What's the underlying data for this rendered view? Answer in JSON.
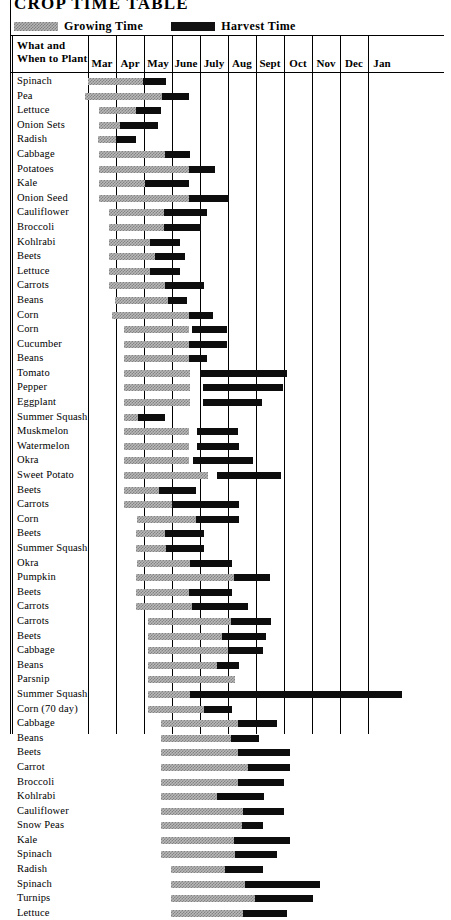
{
  "title": "CROP TIME TABLE",
  "legend": {
    "growing": {
      "label": "Growing Time",
      "swatch": "growing-time-swatch",
      "color": "#b5b5b5"
    },
    "harvest": {
      "label": "Harvest Time",
      "swatch": "harvest-time-swatch",
      "color": "#111111"
    }
  },
  "header": {
    "row_header_line1": "What and",
    "row_header_line2": "When to Plant",
    "months": [
      "Mar",
      "Apr",
      "May",
      "June",
      "July",
      "Aug",
      "Sept",
      "Oct",
      "Nov",
      "Dec",
      "Jan"
    ]
  },
  "chart_data": {
    "type": "bar",
    "title": "CROP TIME TABLE",
    "xlabel": "",
    "ylabel": "What and When to Plant",
    "categories": [
      "Mar",
      "Apr",
      "May",
      "June",
      "July",
      "Aug",
      "Sept",
      "Oct",
      "Nov",
      "Dec",
      "Jan"
    ],
    "xlim": [
      0,
      11
    ],
    "grid": true,
    "legend_position": "top-left",
    "series": [
      {
        "name": "Growing Time",
        "color": "#b5b5b5"
      },
      {
        "name": "Harvest Time",
        "color": "#111111"
      }
    ],
    "note": "x units are months from Mar 1 (0 = Mar 1, 1 = Apr 1, ... 10 = Jan 1, 11 = Feb 1)",
    "rows": [
      {
        "crop": "Spinach",
        "grow": [
          0.0,
          1.95
        ],
        "harvest": [
          1.95,
          2.8
        ]
      },
      {
        "crop": "Pea",
        "grow": [
          -0.1,
          2.65
        ],
        "harvest": [
          2.65,
          3.6
        ]
      },
      {
        "crop": "Lettuce",
        "grow": [
          0.4,
          1.7
        ],
        "harvest": [
          1.7,
          2.6
        ]
      },
      {
        "crop": "Onion Sets",
        "grow": [
          0.4,
          1.15
        ],
        "harvest": [
          1.15,
          2.5
        ]
      },
      {
        "crop": "Radish",
        "grow": [
          0.35,
          1.0
        ],
        "harvest": [
          1.0,
          1.7
        ]
      },
      {
        "crop": "Cabbage",
        "grow": [
          0.4,
          2.75
        ],
        "harvest": [
          2.75,
          3.65
        ]
      },
      {
        "crop": "Potatoes",
        "grow": [
          0.4,
          3.6
        ],
        "harvest": [
          3.6,
          4.55
        ]
      },
      {
        "crop": "Kale",
        "grow": [
          0.4,
          2.05
        ],
        "harvest": [
          2.05,
          3.6
        ]
      },
      {
        "crop": "Onion Seed",
        "grow": [
          0.4,
          3.6
        ],
        "harvest": [
          3.6,
          5.05
        ]
      },
      {
        "crop": "Cauliflower",
        "grow": [
          0.75,
          2.7
        ],
        "harvest": [
          2.7,
          4.25
        ]
      },
      {
        "crop": "Broccoli",
        "grow": [
          0.75,
          2.7
        ],
        "harvest": [
          2.7,
          4.05
        ]
      },
      {
        "crop": "Kohlrabi",
        "grow": [
          0.75,
          2.2
        ],
        "harvest": [
          2.2,
          3.3
        ]
      },
      {
        "crop": "Beets",
        "grow": [
          0.75,
          2.4
        ],
        "harvest": [
          2.4,
          3.45
        ]
      },
      {
        "crop": "Lettuce",
        "grow": [
          0.75,
          2.2
        ],
        "harvest": [
          2.2,
          3.3
        ]
      },
      {
        "crop": "Carrots",
        "grow": [
          0.75,
          2.75
        ],
        "harvest": [
          2.75,
          4.15
        ]
      },
      {
        "crop": "Beans",
        "grow": [
          0.95,
          2.85
        ],
        "harvest": [
          2.85,
          3.55
        ]
      },
      {
        "crop": "Corn",
        "grow": [
          0.85,
          3.6
        ],
        "harvest": [
          3.6,
          4.45
        ]
      },
      {
        "crop": "Corn",
        "grow": [
          1.3,
          3.6
        ],
        "harvest": [
          3.7,
          4.95
        ]
      },
      {
        "crop": "Cucumber",
        "grow": [
          1.3,
          3.6
        ],
        "harvest": [
          3.6,
          4.95
        ]
      },
      {
        "crop": "Beans",
        "grow": [
          1.3,
          3.6
        ],
        "harvest": [
          3.6,
          4.25
        ]
      },
      {
        "crop": "Tomato",
        "grow": [
          1.3,
          3.65
        ],
        "harvest": [
          4.0,
          7.1
        ]
      },
      {
        "crop": "Pepper",
        "grow": [
          1.3,
          3.65
        ],
        "harvest": [
          4.1,
          6.95
        ]
      },
      {
        "crop": "Eggplant",
        "grow": [
          1.3,
          3.65
        ],
        "harvest": [
          4.1,
          6.2
        ]
      },
      {
        "crop": "Summer Squash",
        "grow": [
          1.3,
          1.8
        ],
        "harvest": [
          1.8,
          2.75
        ]
      },
      {
        "crop": "Muskmelon",
        "grow": [
          1.3,
          3.6
        ],
        "harvest": [
          3.9,
          5.35
        ]
      },
      {
        "crop": "Watermelon",
        "grow": [
          1.3,
          3.6
        ],
        "harvest": [
          3.9,
          5.4
        ]
      },
      {
        "crop": "Okra",
        "grow": [
          1.3,
          3.6
        ],
        "harvest": [
          3.75,
          5.9
        ]
      },
      {
        "crop": "Sweet Potato",
        "grow": [
          1.3,
          4.3
        ],
        "harvest": [
          4.6,
          6.9
        ]
      },
      {
        "crop": "Beets",
        "grow": [
          1.3,
          2.55
        ],
        "harvest": [
          2.55,
          3.85
        ]
      },
      {
        "crop": "Carrots",
        "grow": [
          1.3,
          3.0
        ],
        "harvest": [
          3.0,
          5.4
        ]
      },
      {
        "crop": "Corn",
        "grow": [
          1.75,
          3.85
        ],
        "harvest": [
          3.85,
          5.4
        ]
      },
      {
        "crop": "Beets",
        "grow": [
          1.7,
          2.75
        ],
        "harvest": [
          2.75,
          4.15
        ]
      },
      {
        "crop": "Summer Squash",
        "grow": [
          1.7,
          2.8
        ],
        "harvest": [
          2.8,
          4.15
        ]
      },
      {
        "crop": "Okra",
        "grow": [
          1.75,
          3.65
        ],
        "harvest": [
          3.65,
          5.15
        ]
      },
      {
        "crop": "Pumpkin",
        "grow": [
          1.7,
          5.2
        ],
        "harvest": [
          5.2,
          6.5
        ]
      },
      {
        "crop": "Beets",
        "grow": [
          1.7,
          3.6
        ],
        "harvest": [
          3.6,
          5.15
        ]
      },
      {
        "crop": "Carrots",
        "grow": [
          1.7,
          3.7
        ],
        "harvest": [
          3.7,
          5.7
        ]
      },
      {
        "crop": "Carrots",
        "grow": [
          2.15,
          5.1
        ],
        "harvest": [
          5.1,
          6.55
        ]
      },
      {
        "crop": "Beets",
        "grow": [
          2.15,
          4.8
        ],
        "harvest": [
          4.8,
          6.35
        ]
      },
      {
        "crop": "Cabbage",
        "grow": [
          2.15,
          5.0
        ],
        "harvest": [
          5.0,
          6.25
        ]
      },
      {
        "crop": "Beans",
        "grow": [
          2.15,
          4.6
        ],
        "harvest": [
          4.6,
          5.4
        ]
      },
      {
        "crop": "Parsnip",
        "grow": [
          2.15,
          5.25
        ],
        "harvest": [
          5.25,
          5.25
        ]
      },
      {
        "crop": "Summer Squash",
        "grow": [
          2.15,
          3.65
        ],
        "harvest": [
          3.65,
          11.2
        ]
      },
      {
        "crop": "Corn (70 day)",
        "grow": [
          2.15,
          4.15
        ],
        "harvest": [
          4.15,
          5.15
        ]
      },
      {
        "crop": "Cabbage",
        "grow": [
          2.6,
          5.35
        ],
        "harvest": [
          5.35,
          6.75
        ]
      },
      {
        "crop": "Beans",
        "grow": [
          2.6,
          5.1
        ],
        "harvest": [
          5.1,
          6.1
        ]
      },
      {
        "crop": "Beets",
        "grow": [
          2.6,
          5.35
        ],
        "harvest": [
          5.35,
          7.2
        ]
      },
      {
        "crop": "Carrot",
        "grow": [
          2.6,
          5.7
        ],
        "harvest": [
          5.7,
          7.2
        ]
      },
      {
        "crop": "Broccoli",
        "grow": [
          2.6,
          5.35
        ],
        "harvest": [
          5.35,
          7.0
        ]
      },
      {
        "crop": "Kohlrabi",
        "grow": [
          2.6,
          4.6
        ],
        "harvest": [
          4.6,
          6.3
        ]
      },
      {
        "crop": "Cauliflower",
        "grow": [
          2.6,
          5.55
        ],
        "harvest": [
          5.55,
          7.0
        ]
      },
      {
        "crop": "Snow Peas",
        "grow": [
          2.6,
          5.5
        ],
        "harvest": [
          5.5,
          6.25
        ]
      },
      {
        "crop": "Kale",
        "grow": [
          2.6,
          5.2
        ],
        "harvest": [
          5.2,
          7.2
        ]
      },
      {
        "crop": "Spinach",
        "grow": [
          2.6,
          5.25
        ],
        "harvest": [
          5.25,
          6.75
        ]
      },
      {
        "crop": "Radish",
        "grow": [
          2.95,
          4.9
        ],
        "harvest": [
          4.9,
          6.25
        ]
      },
      {
        "crop": "Spinach",
        "grow": [
          2.95,
          5.6
        ],
        "harvest": [
          5.6,
          8.3
        ]
      },
      {
        "crop": "Turnips",
        "grow": [
          2.95,
          5.95
        ],
        "harvest": [
          5.95,
          8.05
        ]
      },
      {
        "crop": "Lettuce",
        "grow": [
          2.95,
          5.55
        ],
        "harvest": [
          5.55,
          7.1
        ]
      }
    ]
  }
}
